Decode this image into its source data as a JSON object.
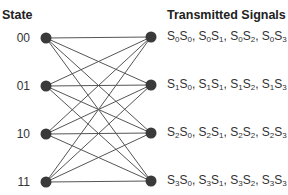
{
  "headings": {
    "state": "State",
    "signals": "Transmitted Signals"
  },
  "states": [
    {
      "label": "00",
      "y": 38
    },
    {
      "label": "01",
      "y": 86
    },
    {
      "label": "10",
      "y": 134
    },
    {
      "label": "11",
      "y": 182
    }
  ],
  "right_nodes_y": [
    37,
    85,
    133,
    181
  ],
  "signals": [
    [
      [
        "0",
        "0"
      ],
      [
        "0",
        "1"
      ],
      [
        "0",
        "2"
      ],
      [
        "0",
        "3"
      ]
    ],
    [
      [
        "1",
        "0"
      ],
      [
        "1",
        "1"
      ],
      [
        "1",
        "2"
      ],
      [
        "1",
        "3"
      ]
    ],
    [
      [
        "2",
        "0"
      ],
      [
        "2",
        "1"
      ],
      [
        "2",
        "2"
      ],
      [
        "2",
        "3"
      ]
    ],
    [
      [
        "3",
        "0"
      ],
      [
        "3",
        "1"
      ],
      [
        "3",
        "2"
      ],
      [
        "3",
        "3"
      ]
    ]
  ],
  "signals_text": [
    "S0S0, S0S1, S0S2, S0S3",
    "S1S0, S1S1, S1S2, S1S3",
    "S2S0, S2S1, S2S2, S2S3",
    "S3S0, S3S1, S3S2, S3S3"
  ],
  "layout": {
    "left_x": 46,
    "right_x": 151,
    "node_radius": 5.5
  },
  "colors": {
    "node": "#3a3a3a",
    "edge": "#555555",
    "text": "#333333"
  }
}
